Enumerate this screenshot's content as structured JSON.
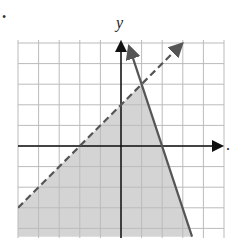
{
  "chart_data": {
    "type": "line",
    "title": "",
    "xlabel": "x",
    "ylabel": "y",
    "xlim": [
      -5,
      5
    ],
    "ylim": [
      -4.3,
      5
    ],
    "grid": true,
    "grid_step": 1,
    "series": [
      {
        "name": "boundary-dashed",
        "equation": "y = x + 2",
        "style": "dashed",
        "points": [
          [
            -5,
            -3
          ],
          [
            3,
            5
          ]
        ]
      },
      {
        "name": "boundary-solid",
        "equation": "y = -3x + 6",
        "style": "solid",
        "points": [
          [
            0.4,
            4.8
          ],
          [
            3.4,
            -4.3
          ]
        ]
      }
    ],
    "shaded_region": "y < x + 2 and y <= -3x + 6",
    "colors": {
      "grid": "#bbbbbb",
      "axis": "#111111",
      "line": "#555555",
      "shade": "#d4d4d4"
    }
  },
  "labels": {
    "y_axis": "y",
    "x_axis": ".",
    "bullet": "•"
  }
}
